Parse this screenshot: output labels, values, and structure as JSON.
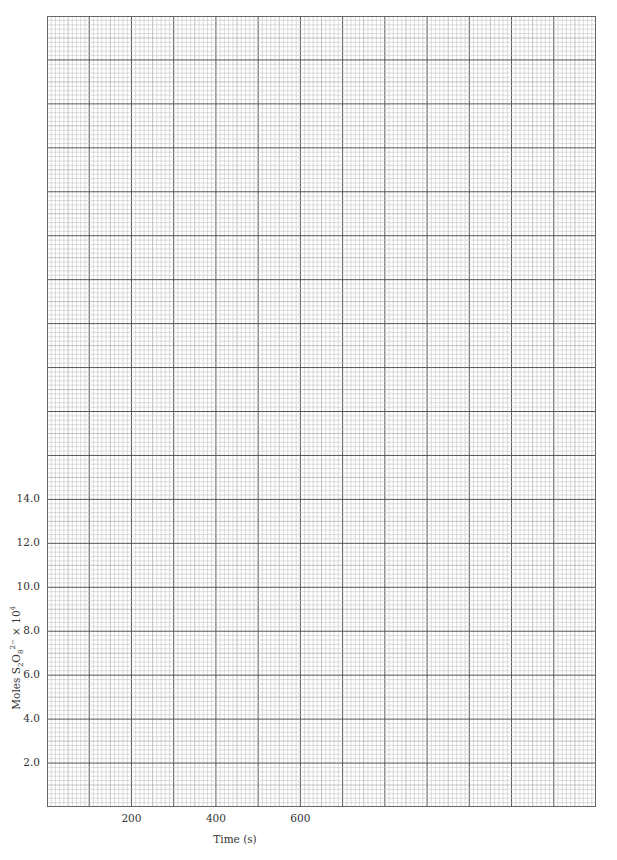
{
  "chart_data": {
    "type": "line",
    "title": "",
    "xlabel": "Time (s)",
    "ylabel": "Moles S2O8 2- x 10^4",
    "x_tick_labels": [
      "200",
      "400",
      "600"
    ],
    "x_ticks": [
      200,
      400,
      600
    ],
    "y_tick_labels": [
      "2.0",
      "4.0",
      "6.0",
      "8.0",
      "10.0",
      "12.0",
      "14.0"
    ],
    "y_ticks": [
      2.0,
      4.0,
      6.0,
      8.0,
      10.0,
      12.0,
      14.0
    ],
    "xlim": [
      0,
      1300
    ],
    "ylim": [
      0,
      36
    ],
    "grid": true,
    "series": [],
    "note": "Blank graph paper with no plotted data"
  },
  "axis": {
    "xlabel_text": "Time (s)",
    "ylabel_prefix": "Moles S",
    "ylabel_sub1": "2",
    "ylabel_mid": "O",
    "ylabel_sub2": "8",
    "ylabel_sup": "2−",
    "ylabel_suffix": " × 10",
    "ylabel_exp": "4"
  }
}
